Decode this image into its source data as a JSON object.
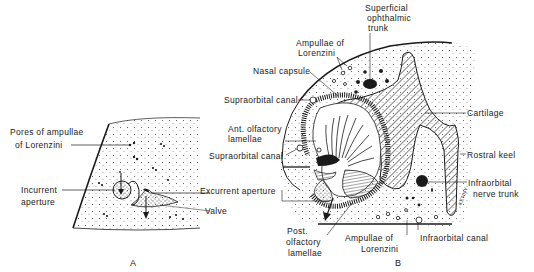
{
  "figure": {
    "panel_a": {
      "letter": "A",
      "labels": {
        "pores_line1": "Pores of ampullae",
        "pores_line2": "of Lorenzini",
        "incurrent_line1": "Incurrent",
        "incurrent_line2": "aperture"
      }
    },
    "panel_b": {
      "letter": "B",
      "labels": {
        "superficial_line1": "Superficial",
        "superficial_line2": "ophthalmic",
        "superficial_line3": "trunk",
        "ampullae_top_line1": "Ampullae of",
        "ampullae_top_line2": "Lorenzini",
        "nasal_capsule": "Nasal capsule",
        "supraorbital_top": "Supraorbital canal",
        "ant_olfactory_line1": "Ant. olfactory",
        "ant_olfactory_line2": "lamellae",
        "supraorbital_bottom": "Supraorbital canal",
        "excurrent": "Excurrent aperture",
        "valve": "Valve",
        "post_olfactory_line1": "Post.",
        "post_olfactory_line2": "olfactory",
        "post_olfactory_line3": "lamellae",
        "ampullae_bottom_line1": "Ampullae of",
        "ampullae_bottom_line2": "Lorenzini",
        "infraorbital_canal": "Infraorbital canal",
        "infraorbital_nerve_line1": "Infraorbital",
        "infraorbital_nerve_line2": "nerve trunk",
        "rostral_keel": "Rostral keel",
        "cartilage": "Cartilage",
        "signature": "KENNY"
      }
    },
    "colors": {
      "ink": "#1a1a1a",
      "paper": "#ffffff"
    }
  }
}
